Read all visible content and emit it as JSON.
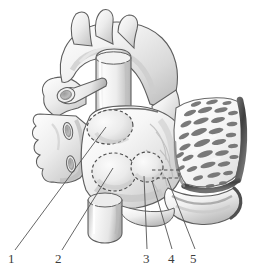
{
  "figure": {
    "name": "heart-left-atrium-posterior-view",
    "kind": "anatomical-line-illustration",
    "style": "grayscale airbrush medical illustration, white background",
    "view": "posterior view of heart with left atrial wall and opened right-sided myocardial flap",
    "palette": {
      "background": "#ffffff",
      "outline": "#5a5a5a",
      "tissue_light": "#f4f4f4",
      "tissue_mid": "#d8d8d8",
      "tissue_shadow": "#a8a8a8",
      "tissue_dark": "#7d7d7d",
      "trabecula": "#6e6e6e",
      "flap_edge_dark": "#4a4a4a",
      "leader_line": "#555555",
      "label_text": "#3c3c3c",
      "dashed_marker": "#4d4d4d"
    },
    "labels": [
      {
        "id": "label-1",
        "text": "1",
        "x": 8,
        "y": 252,
        "leader_from": [
          15,
          250
        ],
        "leader_to": [
          106,
          127
        ]
      },
      {
        "id": "label-2",
        "text": "2",
        "x": 55,
        "y": 252,
        "leader_from": [
          62,
          250
        ],
        "leader_to": [
          113,
          168
        ]
      },
      {
        "id": "label-3",
        "text": "3",
        "x": 143,
        "y": 252,
        "leader_from": [
          147,
          249
        ],
        "leader_to": [
          144,
          176
        ]
      },
      {
        "id": "label-4",
        "text": "4",
        "x": 168,
        "y": 252,
        "leader_from": [
          172,
          249
        ],
        "leader_to": [
          152,
          180
        ]
      },
      {
        "id": "label-5",
        "text": "5",
        "x": 190,
        "y": 252,
        "leader_from": [
          194,
          249
        ],
        "leader_to": [
          168,
          178
        ]
      }
    ],
    "markers": {
      "dashed_ostium_upper": {
        "cx": 110,
        "cy": 127,
        "rx": 23,
        "ry": 17,
        "rotate": -8
      },
      "dashed_ostium_lower": {
        "cx": 114,
        "cy": 172,
        "rx": 22,
        "ry": 19,
        "rotate": 4
      },
      "dashed_ostium_right": {
        "cx": 147,
        "cy": 167,
        "rx": 16,
        "ry": 15,
        "rotate": 0
      },
      "dashed_slit": {
        "x": 152,
        "y": 170,
        "w": 27,
        "h": 8
      }
    },
    "vessel_stumps": [
      {
        "name": "superior-vessel-cut-end",
        "cx": 66,
        "cy": 95,
        "rx": 9,
        "ry": 7
      },
      {
        "name": "middle-vessel-cut-end",
        "cx": 68,
        "cy": 131,
        "rx": 4,
        "ry": 8
      },
      {
        "name": "inferior-vessel-cut-end",
        "cx": 70,
        "cy": 163,
        "rx": 4,
        "ry": 8
      },
      {
        "name": "inferior-vena-cava-stump",
        "cx": 104,
        "cy": 213,
        "rx": 17,
        "ry": 9
      }
    ],
    "regions": [
      {
        "name": "aortic-arch-and-great-vessels",
        "where": "top"
      },
      {
        "name": "pulmonary-trunk",
        "where": "upper-center"
      },
      {
        "name": "left-atrial-posterior-wall",
        "where": "center"
      },
      {
        "name": "trabeculated-myocardial-flap",
        "where": "right"
      },
      {
        "name": "atrioventricular-groove-fold",
        "where": "lower-right"
      }
    ],
    "trabeculae_count": 34
  }
}
